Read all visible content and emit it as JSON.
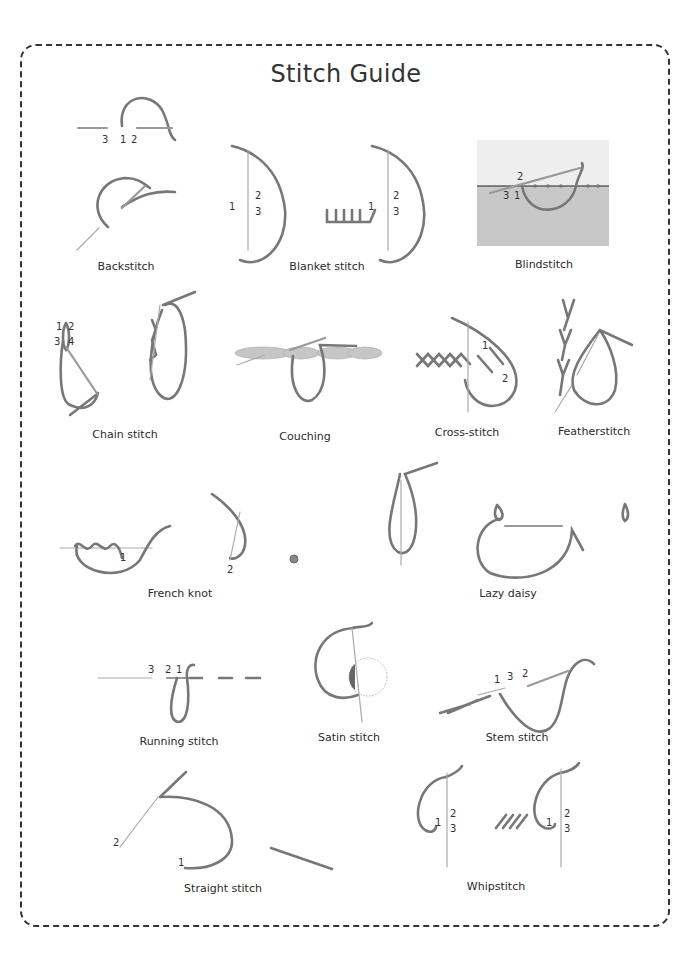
{
  "page": {
    "title": "Stitch Guide",
    "colors": {
      "thread": "#777777",
      "needle": "#999999",
      "fabric_top": "#eeeeee",
      "fabric_bottom": "#c8c8c8",
      "border": "#333333"
    }
  },
  "stitches": [
    {
      "name": "Backstitch",
      "step_numbers": [
        "3",
        "1",
        "2"
      ]
    },
    {
      "name": "Blanket stitch",
      "step_numbers": [
        "1",
        "2",
        "3",
        "1",
        "2",
        "3"
      ]
    },
    {
      "name": "Blindstitch",
      "step_numbers": [
        "2",
        "3",
        "1"
      ]
    },
    {
      "name": "Chain stitch",
      "step_numbers": [
        "1",
        "2",
        "3",
        "4"
      ]
    },
    {
      "name": "Couching",
      "step_numbers": []
    },
    {
      "name": "Cross-stitch",
      "step_numbers": [
        "1",
        "2"
      ]
    },
    {
      "name": "Featherstitch",
      "step_numbers": []
    },
    {
      "name": "French knot",
      "step_numbers": [
        "1",
        "2"
      ]
    },
    {
      "name": "Lazy daisy",
      "step_numbers": []
    },
    {
      "name": "Running stitch",
      "step_numbers": [
        "3",
        "2",
        "1"
      ]
    },
    {
      "name": "Satin stitch",
      "step_numbers": []
    },
    {
      "name": "Stem stitch",
      "step_numbers": [
        "1",
        "3",
        "2"
      ]
    },
    {
      "name": "Straight stitch",
      "step_numbers": [
        "2",
        "1"
      ]
    },
    {
      "name": "Whipstitch",
      "step_numbers": [
        "2",
        "1",
        "3",
        "2",
        "1",
        "3"
      ]
    }
  ]
}
